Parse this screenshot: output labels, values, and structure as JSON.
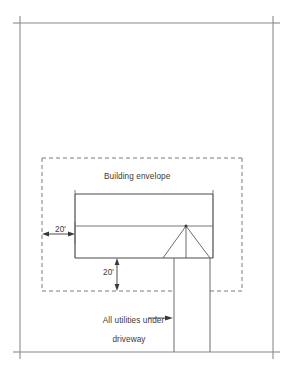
{
  "diagram": {
    "type": "site-plan",
    "canvas": {
      "width": 289,
      "height": 374
    },
    "colors": {
      "line": "#555555",
      "line_dark": "#3f3f3f",
      "dashed": "#7a7a7a",
      "text": "#3a3a3a",
      "background": "#ffffff"
    }
  },
  "labels": {
    "building_envelope": "Building envelope",
    "setback_left": "20'",
    "setback_bottom": "20'",
    "utilities_line1": "All utilities under",
    "utilities_line2": "driveway"
  },
  "geometry": {
    "border": {
      "x1": 20,
      "y1": 23,
      "x2": 273,
      "y2": 352,
      "tick": 7
    },
    "envelope": {
      "x1": 42,
      "y1": 158,
      "x2": 242,
      "y2": 291,
      "dash": "4 3"
    },
    "building": {
      "x1": 75,
      "y1": 194,
      "x2": 213,
      "y2": 258,
      "divider_y": 226
    },
    "entry_triangle": {
      "base_x1": 163,
      "base_x2": 210,
      "base_y": 258,
      "apex_x": 186,
      "apex_y": 226
    },
    "driveway": {
      "left_x": 174,
      "right_x": 210,
      "y_top": 258,
      "y_bottom": 352
    },
    "dim_left": {
      "y": 234,
      "x1": 44,
      "x2": 74
    },
    "dim_bottom": {
      "x": 117,
      "y1": 259,
      "y2": 290
    },
    "leader_utilities": {
      "x1": 148,
      "x2": 172,
      "y": 318
    }
  },
  "annotations": {
    "setback_left_value": 20,
    "setback_bottom_value": 20,
    "setback_units": "feet"
  }
}
